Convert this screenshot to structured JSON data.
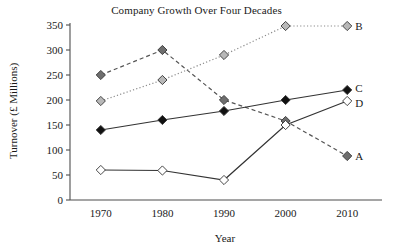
{
  "chart_data": {
    "type": "line",
    "title": "Company Growth Over Four Decades",
    "xlabel": "Year",
    "ylabel": "Turnover (£ Millions)",
    "x": [
      1970,
      1980,
      1990,
      2000,
      2010
    ],
    "xtick_labels": [
      "1970",
      "1980",
      "1990",
      "2000",
      "2010"
    ],
    "ytick_labels": [
      "0",
      "50",
      "100",
      "150",
      "200",
      "250",
      "300",
      "350"
    ],
    "yticks": [
      0,
      50,
      100,
      150,
      200,
      250,
      300,
      350
    ],
    "ylim": [
      0,
      350
    ],
    "xlim": [
      1965,
      2015
    ],
    "grid": false,
    "legend_position": "right-of-line-ends",
    "series": [
      {
        "name": "A",
        "label": "A",
        "values": [
          250,
          300,
          200,
          158,
          88
        ],
        "line_style": "dashed",
        "marker": "diamond",
        "marker_fill": "#6e6e6e",
        "line_color": "#555555"
      },
      {
        "name": "B",
        "label": "B",
        "values": [
          198,
          240,
          290,
          348,
          348
        ],
        "line_style": "dotted",
        "marker": "diamond",
        "marker_fill": "#b8b8b8",
        "line_color": "#8a8a8a"
      },
      {
        "name": "C",
        "label": "C",
        "values": [
          140,
          160,
          178,
          200,
          220
        ],
        "line_style": "solid",
        "marker": "diamond",
        "marker_fill": "#111111",
        "line_color": "#333333"
      },
      {
        "name": "D",
        "label": "D",
        "values": [
          60,
          59,
          40,
          150,
          198
        ],
        "line_style": "solid",
        "marker": "diamond",
        "marker_fill": "#ffffff",
        "line_color": "#333333"
      }
    ]
  },
  "axis": {
    "color": "#4d4d4d"
  }
}
